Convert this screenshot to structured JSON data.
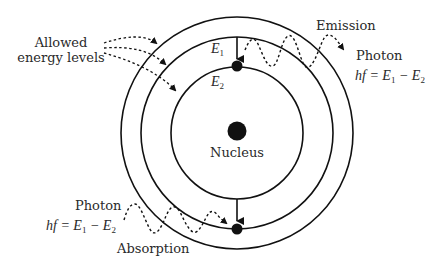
{
  "diagram": {
    "type": "Bohr atom energy levels: emission and absorption",
    "labels": {
      "allowed_line1": "Allowed",
      "allowed_line2": "energy levels",
      "nucleus": "Nucleus",
      "emission": "Emission",
      "absorption": "Absorption",
      "photon_emit": "Photon",
      "photon_absorb": "Photon",
      "formula_lhs": "hf",
      "formula_eq": " = ",
      "E": "E",
      "sub1": "1",
      "sub2": "2",
      "minus": " − ",
      "level_upper": "E",
      "level_upper_sub": "1",
      "level_lower": "E",
      "level_lower_sub": "2"
    },
    "orbits": [
      {
        "name": "outer",
        "radius": 116
      },
      {
        "name": "middle-E1",
        "radius": 96
      },
      {
        "name": "inner-E2",
        "radius": 66
      }
    ],
    "colors": {
      "line": "#111111",
      "text": "#2a2a2a",
      "background": "#ffffff"
    }
  }
}
